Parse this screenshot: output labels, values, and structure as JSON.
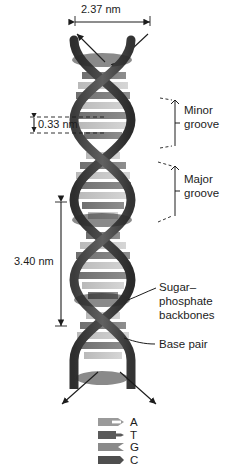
{
  "figure": {
    "background": "#ffffff",
    "text_color": "#1c1c1c"
  },
  "dimensions": [
    {
      "id": "width",
      "value": "2.37 nm",
      "orientation": "horizontal",
      "position": "top"
    },
    {
      "id": "rise",
      "value": "0.33 nm",
      "orientation": "vertical",
      "position": "left-upper"
    },
    {
      "id": "pitch",
      "value": "3.40 nm",
      "orientation": "vertical",
      "position": "left-lower"
    }
  ],
  "callouts": [
    {
      "id": "minor-groove",
      "line1": "Minor",
      "line2": "groove",
      "style": "bracket"
    },
    {
      "id": "major-groove",
      "line1": "Major",
      "line2": "groove",
      "style": "bracket"
    },
    {
      "id": "sugar-phosphate-backbones",
      "line1": "Sugar–",
      "line2": "phosphate",
      "line3": "backbones",
      "style": "leader"
    },
    {
      "id": "base-pair",
      "line1": "Base pair",
      "style": "leader"
    }
  ],
  "legend": {
    "items": [
      {
        "label": "A",
        "color": "#9a9a9a",
        "shape": "notched-arrow"
      },
      {
        "label": "T",
        "color": "#5a5a5a",
        "shape": "tab-arrow"
      },
      {
        "label": "G",
        "color": "#8a8a8a",
        "shape": "notched-arrow"
      },
      {
        "label": "C",
        "color": "#4e4e4e",
        "shape": "tab-arrow"
      }
    ]
  },
  "helix": {
    "backbone_color_dark": "#3a3a3a",
    "backbone_color_mid": "#555555",
    "base_color_light": "#c8c8c8",
    "base_color_mid": "#9e9e9e",
    "base_color_dark": "#6b6b6b",
    "arrows": {
      "top_count": 2,
      "bottom_count": 2
    }
  }
}
